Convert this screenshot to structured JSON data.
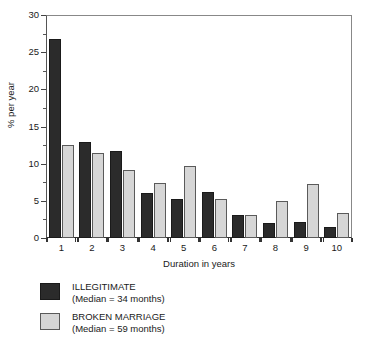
{
  "chart_data": {
    "type": "bar",
    "title": "",
    "xlabel": "Duration in years",
    "ylabel": "% per year",
    "categories": [
      "1",
      "2",
      "3",
      "4",
      "5",
      "6",
      "7",
      "8",
      "9",
      "10"
    ],
    "ylim": [
      0,
      30
    ],
    "y_ticks": [
      0,
      5,
      10,
      15,
      20,
      25,
      30
    ],
    "y_tick_labels": [
      "0",
      "5",
      "10",
      "15",
      "20",
      "25",
      "30"
    ],
    "y_minor_ticks": [
      2.5,
      7.5,
      12.5,
      17.5,
      22.5,
      27.5
    ],
    "grid": false,
    "legend_position": "below-left",
    "series": [
      {
        "name": "ILLEGITIMATE",
        "sublabel": "(Median = 34 months)",
        "color": "#2b2b2b",
        "values": [
          26.8,
          12.9,
          11.7,
          6.0,
          5.2,
          6.2,
          3.1,
          2.0,
          2.2,
          1.5
        ]
      },
      {
        "name": "BROKEN MARRIAGE",
        "sublabel": "(Median = 59 months)",
        "color": "#d6d6d6",
        "values": [
          12.5,
          11.5,
          9.2,
          7.4,
          9.7,
          5.2,
          3.1,
          5.0,
          7.2,
          3.4
        ]
      }
    ]
  },
  "legend": {
    "items": [
      {
        "label": "ILLEGITIMATE",
        "sublabel": "(Median = 34 months)",
        "swatch": "dark"
      },
      {
        "label": "BROKEN MARRIAGE",
        "sublabel": "(Median = 59 months)",
        "swatch": "light"
      }
    ]
  }
}
